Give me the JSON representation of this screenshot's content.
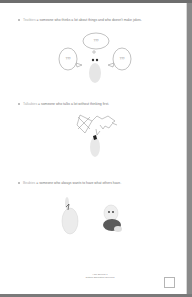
{
  "items": [
    {
      "term": "Teatbies",
      "definition": " = someone who thinks a lot about things and who doesn't make jokes.",
      "icon": "thinking-ghost-illustration"
    },
    {
      "term": "Talkabies",
      "definition": " = someone who talks a lot without thinking first.",
      "icon": "talking-ghost-illustration"
    },
    {
      "term": "Beabies",
      "definition": " = someone who always wants to have what others have.",
      "icon": "jealous-bunnies-illustration"
    }
  ],
  "thought_bubbles": [
    "???",
    "???",
    "???"
  ],
  "footer": {
    "line1": "I am Special 1",
    "line2": "Ontario Education Services"
  }
}
